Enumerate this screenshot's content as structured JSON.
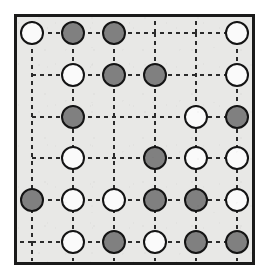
{
  "figure": {
    "kind": "lattice-board-diagram"
  },
  "canvas": {
    "width": 269,
    "height": 279,
    "background_color": "#ffffff"
  },
  "board": {
    "frame": {
      "x": 14,
      "y": 14,
      "width": 241,
      "height": 251,
      "border_color": "#1a1a1a",
      "border_width": 3,
      "fill_color": "#e8e8e6"
    },
    "grid": {
      "rows": 6,
      "columns": 6,
      "column_x": [
        32,
        73,
        114,
        155,
        196,
        237
      ],
      "row_y": [
        33,
        75,
        117,
        158,
        200,
        242
      ],
      "line_color": "#2b2b2b",
      "line_width": 2,
      "dash_pattern": "4,4"
    },
    "disc": {
      "radius": 11,
      "stroke_color": "#141414",
      "stroke_width": 2,
      "white_fill": "#fafafa",
      "gray_fill": "#808080"
    },
    "legend": {
      "white_label": "white",
      "gray_label": "gray",
      "empty_label": "empty"
    },
    "cells": [
      [
        {
          "row": 1,
          "col": 1,
          "state": "white"
        },
        {
          "row": 1,
          "col": 2,
          "state": "gray"
        },
        {
          "row": 1,
          "col": 3,
          "state": "gray"
        },
        {
          "row": 1,
          "col": 4,
          "state": "empty"
        },
        {
          "row": 1,
          "col": 5,
          "state": "empty"
        },
        {
          "row": 1,
          "col": 6,
          "state": "white"
        }
      ],
      [
        {
          "row": 2,
          "col": 1,
          "state": "empty"
        },
        {
          "row": 2,
          "col": 2,
          "state": "white"
        },
        {
          "row": 2,
          "col": 3,
          "state": "gray"
        },
        {
          "row": 2,
          "col": 4,
          "state": "gray"
        },
        {
          "row": 2,
          "col": 5,
          "state": "empty"
        },
        {
          "row": 2,
          "col": 6,
          "state": "white"
        }
      ],
      [
        {
          "row": 3,
          "col": 1,
          "state": "empty"
        },
        {
          "row": 3,
          "col": 2,
          "state": "gray"
        },
        {
          "row": 3,
          "col": 3,
          "state": "empty"
        },
        {
          "row": 3,
          "col": 4,
          "state": "empty"
        },
        {
          "row": 3,
          "col": 5,
          "state": "white"
        },
        {
          "row": 3,
          "col": 6,
          "state": "gray"
        }
      ],
      [
        {
          "row": 4,
          "col": 1,
          "state": "empty"
        },
        {
          "row": 4,
          "col": 2,
          "state": "white"
        },
        {
          "row": 4,
          "col": 3,
          "state": "empty"
        },
        {
          "row": 4,
          "col": 4,
          "state": "gray"
        },
        {
          "row": 4,
          "col": 5,
          "state": "white"
        },
        {
          "row": 4,
          "col": 6,
          "state": "white"
        }
      ],
      [
        {
          "row": 5,
          "col": 1,
          "state": "gray"
        },
        {
          "row": 5,
          "col": 2,
          "state": "white"
        },
        {
          "row": 5,
          "col": 3,
          "state": "white"
        },
        {
          "row": 5,
          "col": 4,
          "state": "gray"
        },
        {
          "row": 5,
          "col": 5,
          "state": "gray"
        },
        {
          "row": 5,
          "col": 6,
          "state": "white"
        }
      ],
      [
        {
          "row": 6,
          "col": 1,
          "state": "empty"
        },
        {
          "row": 6,
          "col": 2,
          "state": "white"
        },
        {
          "row": 6,
          "col": 3,
          "state": "gray"
        },
        {
          "row": 6,
          "col": 4,
          "state": "white"
        },
        {
          "row": 6,
          "col": 5,
          "state": "gray"
        },
        {
          "row": 6,
          "col": 6,
          "state": "gray"
        }
      ]
    ],
    "counts": {
      "white": 14,
      "gray": 14,
      "empty": 8,
      "total_nodes": 36
    }
  }
}
